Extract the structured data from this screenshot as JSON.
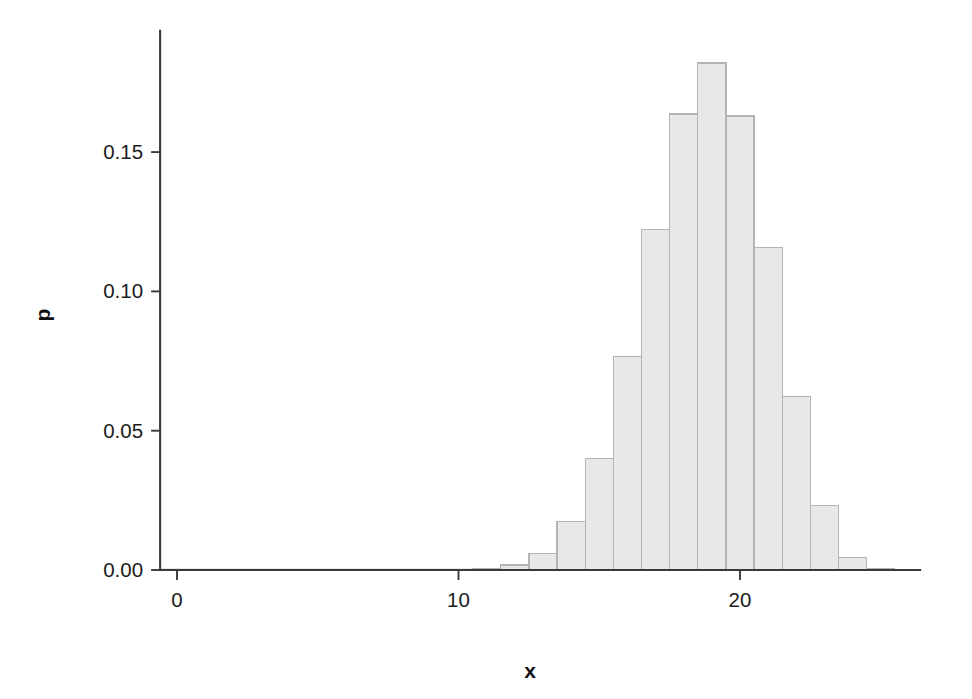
{
  "chart_data": {
    "type": "bar",
    "title": "",
    "subtitle": "",
    "xlabel": "x",
    "ylabel": "p",
    "grid": false,
    "legend": null,
    "xlim": [
      -0.6,
      26.4
    ],
    "ylim": [
      0.0,
      0.1935
    ],
    "xticks": [
      0,
      10,
      20
    ],
    "xticklabels": [
      "0",
      "10",
      "20"
    ],
    "yticks": [
      0.0,
      0.05,
      0.1,
      0.15
    ],
    "yticklabels": [
      "0.00",
      "0.05",
      "0.10",
      "0.15"
    ],
    "bar_width": 1.0,
    "bar_fill": "#e8e8e8",
    "bar_edge": "#b4b4b4",
    "axis_color": "#3a3a3a",
    "categories": [
      0,
      1,
      2,
      3,
      4,
      5,
      6,
      7,
      8,
      9,
      10,
      11,
      12,
      13,
      14,
      15,
      16,
      17,
      18,
      19,
      20,
      21,
      22,
      23,
      24,
      25
    ],
    "values": [
      0.0,
      0.0,
      0.0,
      0.0,
      0.0,
      0.0,
      0.0,
      0.0,
      0.0,
      0.0,
      0.0,
      0.0005,
      0.0018,
      0.0058,
      0.0175,
      0.04,
      0.0767,
      0.1223,
      0.1637,
      0.182,
      0.163,
      0.1157,
      0.0623,
      0.0232,
      0.0044,
      0.0004
    ],
    "value_labels": [
      "0.0000",
      "0.0000",
      "0.0000",
      "0.0000",
      "0.0000",
      "0.0000",
      "0.0000",
      "0.0000",
      "0.0000",
      "0.0000",
      "0.0000",
      "0.0005",
      "0.0018",
      "0.0058",
      "0.0175",
      "0.0400",
      "0.0767",
      "0.1223",
      "0.1637",
      "0.1820",
      "0.1630",
      "0.1157",
      "0.0623",
      "0.0232",
      "0.0044",
      "0.0004"
    ]
  },
  "axes": {
    "x_title": "x",
    "y_title": "p"
  }
}
